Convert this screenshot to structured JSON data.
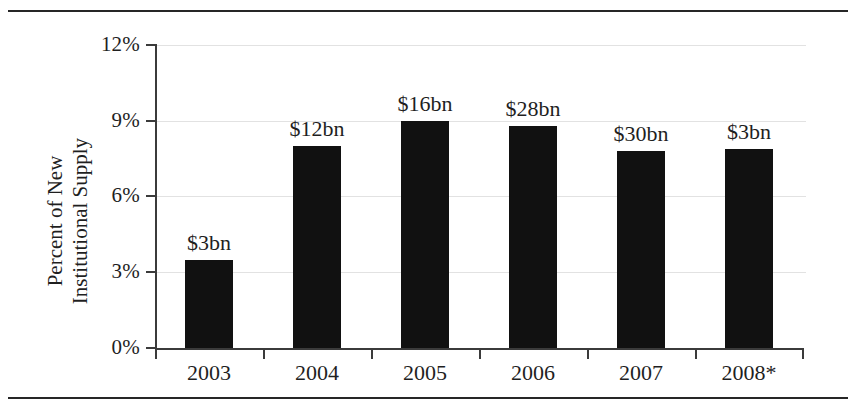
{
  "chart_data": {
    "type": "bar",
    "title": "",
    "subtitle": "",
    "xlabel": "",
    "ylabel_line1": "Percent of New",
    "ylabel_line2": "Institutional Supply",
    "categories": [
      "2003",
      "2004",
      "2005",
      "2006",
      "2007",
      "2008*"
    ],
    "values": [
      3.5,
      8.0,
      9.0,
      8.8,
      7.8,
      7.9
    ],
    "point_labels": [
      "$3bn",
      "$12bn",
      "$16bn",
      "$28bn",
      "$30bn",
      "$3bn"
    ],
    "ylim": [
      0,
      12
    ],
    "yticks": [
      0,
      3,
      6,
      9,
      12
    ],
    "ytick_labels": [
      "0%",
      "3%",
      "6%",
      "9%",
      "12%"
    ],
    "grid": true,
    "legend": "none",
    "bar_color": "#111111",
    "grid_color": "#e2e2e2",
    "axis_color": "#3b3b3b",
    "text_color": "#1f1f1f"
  },
  "figure": {
    "top_rule": "",
    "bottom_rule": ""
  }
}
